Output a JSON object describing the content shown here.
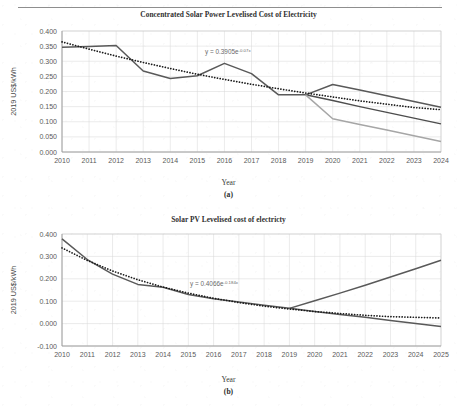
{
  "page": {
    "header_ghost": "",
    "figures": [
      {
        "id": "fig-a",
        "caption": "(a)",
        "title": "Concentrated Solar Power Levelised Cost of Electricity",
        "xlabel": "Year",
        "ylabel": "2019 US$/kWh",
        "equation_base": "y = 0.3905e",
        "equation_exp": "-0.07x"
      },
      {
        "id": "fig-b",
        "caption": "(b)",
        "title": "Solar PV Levelised cost of electricty",
        "xlabel": "Year",
        "ylabel": "2019 US$/kWh",
        "equation_base": "y = 0.4066e",
        "equation_exp": "-0.184x"
      }
    ]
  },
  "colors": {
    "series_dark": "#595959",
    "series_mid": "#4d4d4d",
    "series_light": "#a6a6a6",
    "trend_dotted": "#1a1a1a",
    "grid": "#d6d6d6",
    "text": "#5a5a5a"
  },
  "chart_data": [
    {
      "type": "line",
      "id": "csp-lcoe",
      "title": "Concentrated Solar Power Levelised Cost of Electricity",
      "xlabel": "Year",
      "ylabel": "2019 US$/kWh",
      "categories": [
        2010,
        2011,
        2012,
        2013,
        2014,
        2015,
        2016,
        2017,
        2018,
        2019,
        2020,
        2021,
        2022,
        2023,
        2024
      ],
      "ylim": [
        0.0,
        0.4
      ],
      "ytick_step": 0.05,
      "yticks": [
        "0.000",
        "0.050",
        "0.100",
        "0.150",
        "0.200",
        "0.250",
        "0.300",
        "0.350",
        "0.400"
      ],
      "grid": true,
      "legend": "none",
      "annotation": "y = 0.3905e-0.07x",
      "series": [
        {
          "name": "Historic LCOE",
          "style": "solid",
          "color": "#595959",
          "x": [
            2010,
            2011,
            2012,
            2013,
            2014,
            2015,
            2016,
            2017,
            2018,
            2019
          ],
          "values": [
            0.346,
            0.349,
            0.352,
            0.268,
            0.243,
            0.252,
            0.293,
            0.259,
            0.189,
            0.189
          ]
        },
        {
          "name": "Projection high",
          "style": "solid",
          "color": "#595959",
          "x": [
            2019,
            2020,
            2021,
            2022,
            2023,
            2024
          ],
          "values": [
            0.189,
            0.223,
            0.205,
            0.186,
            0.167,
            0.148
          ]
        },
        {
          "name": "Projection mid",
          "style": "solid",
          "color": "#4d4d4d",
          "x": [
            2019,
            2020,
            2021,
            2022,
            2023,
            2024
          ],
          "values": [
            0.189,
            0.17,
            0.15,
            0.131,
            0.112,
            0.093
          ]
        },
        {
          "name": "Projection low",
          "style": "solid",
          "color": "#a6a6a6",
          "x": [
            2019,
            2020,
            2021,
            2022,
            2023,
            2024
          ],
          "values": [
            0.189,
            0.11,
            0.091,
            0.073,
            0.054,
            0.035
          ]
        },
        {
          "name": "Exponential trendline",
          "style": "dotted",
          "color": "#1a1a1a",
          "x": [
            2010,
            2011,
            2012,
            2013,
            2014,
            2015,
            2016,
            2017,
            2018,
            2019,
            2020,
            2021,
            2022,
            2023,
            2024
          ],
          "values": [
            0.364,
            0.34,
            0.317,
            0.296,
            0.276,
            0.257,
            0.24,
            0.224,
            0.209,
            0.195,
            0.182,
            0.169,
            0.158,
            0.147,
            0.14
          ]
        }
      ]
    },
    {
      "type": "line",
      "id": "pv-lcoe",
      "title": "Solar PV Levelised cost of electricty",
      "xlabel": "Year",
      "ylabel": "2019 US$/kWh",
      "categories": [
        2010,
        2011,
        2012,
        2013,
        2014,
        2015,
        2016,
        2017,
        2018,
        2019,
        2020,
        2021,
        2022,
        2023,
        2024,
        2025
      ],
      "ylim": [
        -0.1,
        0.4
      ],
      "ytick_step": 0.1,
      "yticks": [
        "-0.100",
        "0.000",
        "0.100",
        "0.200",
        "0.300",
        "0.400"
      ],
      "grid": true,
      "legend": "none",
      "annotation": "y = 0.4066e-0.184x",
      "series": [
        {
          "name": "Historic LCOE",
          "style": "solid",
          "color": "#595959",
          "x": [
            2010,
            2011,
            2012,
            2013,
            2014,
            2015,
            2016,
            2017,
            2018,
            2019
          ],
          "values": [
            0.378,
            0.286,
            0.221,
            0.175,
            0.162,
            0.13,
            0.111,
            0.096,
            0.082,
            0.068
          ]
        },
        {
          "name": "Projection rising",
          "style": "solid",
          "color": "#595959",
          "x": [
            2019,
            2020,
            2021,
            2022,
            2023,
            2024,
            2025
          ],
          "values": [
            0.068,
            0.102,
            0.136,
            0.171,
            0.208,
            0.245,
            0.283
          ]
        },
        {
          "name": "Projection falling",
          "style": "solid",
          "color": "#595959",
          "x": [
            2019,
            2020,
            2021,
            2022,
            2023,
            2024,
            2025
          ],
          "values": [
            0.068,
            0.054,
            0.041,
            0.028,
            0.014,
            0.0,
            -0.013
          ]
        },
        {
          "name": "Exponential trendline",
          "style": "dotted",
          "color": "#1a1a1a",
          "x": [
            2010,
            2011,
            2012,
            2013,
            2014,
            2015,
            2016,
            2017,
            2018,
            2019,
            2020,
            2021,
            2022,
            2023,
            2024,
            2025
          ],
          "values": [
            0.338,
            0.282,
            0.235,
            0.196,
            0.163,
            0.136,
            0.113,
            0.094,
            0.078,
            0.065,
            0.054,
            0.045,
            0.037,
            0.031,
            0.028,
            0.025
          ]
        }
      ]
    }
  ]
}
